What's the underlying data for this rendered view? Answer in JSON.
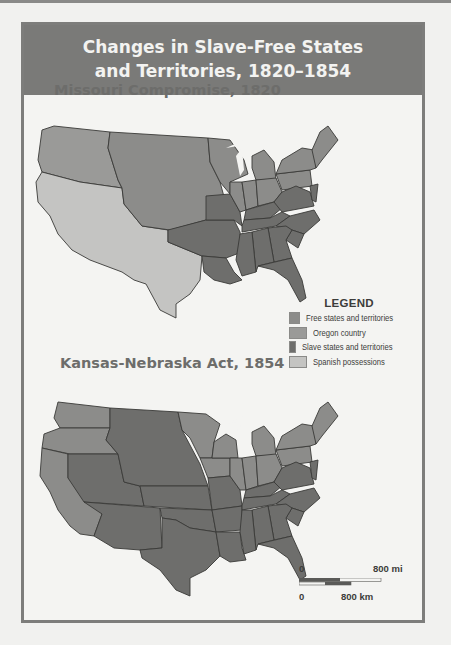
{
  "header": {
    "title_line1": "Changes in Slave-Free States",
    "title_line2": "and Territories, 1820–1854"
  },
  "maps": [
    {
      "title": "Missouri Compromise, 1820"
    },
    {
      "title": "Kansas-Nebraska Act, 1854"
    }
  ],
  "legend": {
    "title": "LEGEND",
    "items": [
      {
        "label": "Free states and territories",
        "color": "#8c8c8a"
      },
      {
        "label": "Oregon country",
        "color": "#9a9a98"
      },
      {
        "label": "Slave states and territories",
        "color": "#6e6e6c"
      },
      {
        "label": "Spanish possessions",
        "color": "#c4c4c2"
      }
    ]
  },
  "scale_bar": {
    "mi_start": "0",
    "mi_end": "800 mi",
    "km_start": "0",
    "km_end": "800 km"
  },
  "colors": {
    "free": "#8c8c8a",
    "oregon": "#9a9a98",
    "slave": "#6e6e6c",
    "spanish": "#c4c4c2",
    "frame": "#7d7d7b",
    "background": "#f4f4f2"
  }
}
